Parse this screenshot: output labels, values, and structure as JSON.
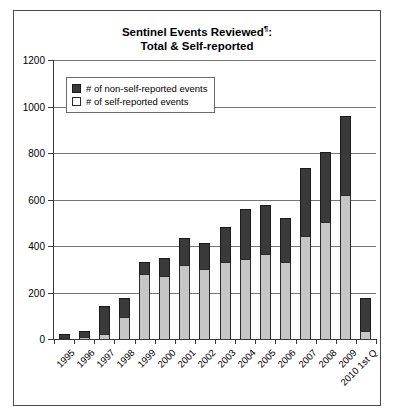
{
  "title": {
    "line1": "Sentinel Events Reviewed",
    "superscript": "¶",
    "line1_suffix": ":",
    "line2": "Total & Self-reported"
  },
  "legend": {
    "items": [
      {
        "label": "# of non-self-reported events",
        "swatch": "dark-swatch-icon",
        "color": "#3a3a3a"
      },
      {
        "label": "# of self-reported events",
        "swatch": "light-swatch-icon",
        "color": "#c6c6c6"
      }
    ]
  },
  "axes": {
    "y_ticks": [
      "1200",
      "1000",
      "800",
      "600",
      "400",
      "200",
      "0"
    ]
  },
  "chart_data": {
    "type": "bar",
    "subtype": "stacked",
    "title": "Sentinel Events Reviewed¶: Total & Self-reported",
    "xlabel": "",
    "ylabel": "",
    "ylim": [
      0,
      1200
    ],
    "ytick_step": 200,
    "grid": true,
    "legend_position": "inside-top-left",
    "categories": [
      "1995",
      "1996",
      "1997",
      "1998",
      "1999",
      "2000",
      "2001",
      "2002",
      "2003",
      "2004",
      "2005",
      "2006",
      "2007",
      "2008",
      "2009",
      "2010 1st Q"
    ],
    "series": [
      {
        "name": "# of self-reported events",
        "color": "#c6c6c6",
        "values": [
          5,
          8,
          20,
          95,
          280,
          270,
          320,
          300,
          330,
          345,
          365,
          330,
          445,
          505,
          620,
          35
        ]
      },
      {
        "name": "# of non-self-reported events",
        "color": "#3a3a3a",
        "values": [
          15,
          27,
          120,
          80,
          50,
          80,
          115,
          115,
          150,
          215,
          210,
          190,
          290,
          300,
          340,
          140
        ]
      }
    ],
    "totals": [
      20,
      35,
      140,
      175,
      330,
      350,
      435,
      415,
      480,
      560,
      575,
      520,
      735,
      805,
      960,
      175
    ]
  }
}
